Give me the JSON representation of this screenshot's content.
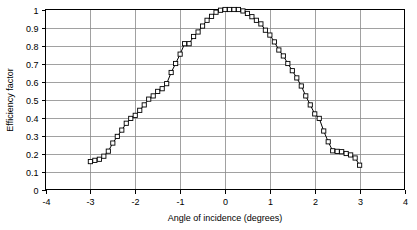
{
  "chart_data": {
    "type": "line",
    "title": "",
    "xlabel": "Angle of incidence (degrees)",
    "ylabel": "Efficiency factor",
    "xlim": [
      -4,
      4
    ],
    "ylim": [
      0,
      1
    ],
    "xticks": [
      "-4",
      "-3",
      "-2",
      "-1",
      "0",
      "1",
      "2",
      "3",
      "4"
    ],
    "xtick_values": [
      -4,
      -3,
      -2,
      -1,
      0,
      1,
      2,
      3,
      4
    ],
    "yticks": [
      "0",
      "0.1",
      "0.2",
      "0.3",
      "0.4",
      "0.5",
      "0.6",
      "0.7",
      "0.8",
      "0.9",
      "1"
    ],
    "ytick_values": [
      0,
      0.1,
      0.2,
      0.3,
      0.4,
      0.5,
      0.6,
      0.7,
      0.8,
      0.9,
      1
    ],
    "grid": true,
    "legend": false,
    "marker": "square-open",
    "line_color": "#000000",
    "grid_color": "#8a8a8a",
    "series": [
      {
        "name": "Efficiency factor",
        "x": [
          -3.0,
          -2.9,
          -2.8,
          -2.7,
          -2.6,
          -2.5,
          -2.4,
          -2.3,
          -2.2,
          -2.1,
          -2.0,
          -1.9,
          -1.8,
          -1.7,
          -1.6,
          -1.5,
          -1.4,
          -1.3,
          -1.2,
          -1.1,
          -1.0,
          -0.9,
          -0.8,
          -0.7,
          -0.6,
          -0.5,
          -0.4,
          -0.3,
          -0.2,
          -0.1,
          0.0,
          0.1,
          0.2,
          0.3,
          0.4,
          0.5,
          0.6,
          0.7,
          0.8,
          0.9,
          1.0,
          1.1,
          1.2,
          1.3,
          1.4,
          1.5,
          1.6,
          1.7,
          1.8,
          1.9,
          2.0,
          2.1,
          2.2,
          2.3,
          2.4,
          2.5,
          2.6,
          2.7,
          2.8,
          2.9,
          3.0
        ],
        "y": [
          0.155,
          0.162,
          0.168,
          0.185,
          0.213,
          0.258,
          0.295,
          0.33,
          0.368,
          0.395,
          0.412,
          0.44,
          0.47,
          0.502,
          0.52,
          0.545,
          0.56,
          0.588,
          0.65,
          0.7,
          0.752,
          0.81,
          0.81,
          0.85,
          0.875,
          0.908,
          0.94,
          0.962,
          0.985,
          0.996,
          1.0,
          1.0,
          1.0,
          1.0,
          0.992,
          0.978,
          0.96,
          0.94,
          0.92,
          0.885,
          0.858,
          0.82,
          0.775,
          0.742,
          0.7,
          0.66,
          0.62,
          0.575,
          0.52,
          0.47,
          0.42,
          0.395,
          0.325,
          0.265,
          0.215,
          0.212,
          0.21,
          0.2,
          0.192,
          0.175,
          0.135
        ]
      }
    ]
  }
}
